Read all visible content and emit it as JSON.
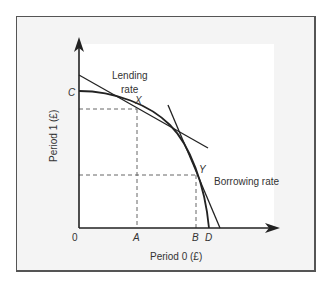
{
  "diagram": {
    "type": "production-possibility-frontier",
    "axes": {
      "x_label": "Period 0 (£)",
      "y_label": "Period 1 (£)",
      "origin_label": "0"
    },
    "curve_labels": {
      "lending_line_1": "Lending",
      "lending_line_2": "rate",
      "borrowing": "Borrowing rate"
    },
    "points": {
      "C": "C",
      "X": "X",
      "Y": "Y",
      "A": "A",
      "B": "B",
      "D": "D"
    },
    "colors": {
      "background": "#f4f4f4",
      "frame": "#555555",
      "curve": "#222222",
      "dashed": "#555555",
      "text": "#333333"
    }
  }
}
